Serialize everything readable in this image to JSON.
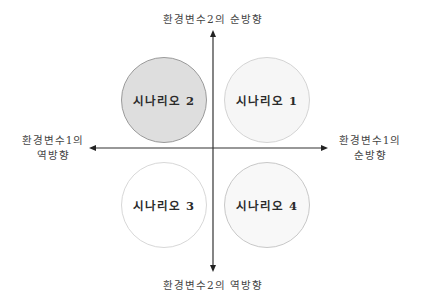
{
  "diagram": {
    "type": "scenario-matrix",
    "axes": {
      "vertical": {
        "top_label": "환경변수2의  순방향",
        "bottom_label": "환경변수2의  역방향"
      },
      "horizontal": {
        "left_label_line1": "환경변수1의",
        "left_label_line2": "역방향",
        "right_label_line1": "환경변수1의",
        "right_label_line2": "순방향"
      }
    },
    "scenarios": [
      {
        "label": "시나리오 2",
        "quadrant": "top-left",
        "fill": "#dedede",
        "border": "#9a9a9a"
      },
      {
        "label": "시나리오 1",
        "quadrant": "top-right",
        "fill": "#f6f6f6",
        "border": "#d4d4d4"
      },
      {
        "label": "시나리오 3",
        "quadrant": "bottom-left",
        "fill": "#ffffff",
        "border": "#d8d8d8"
      },
      {
        "label": "시나리오 4",
        "quadrant": "bottom-right",
        "fill": "#f8f8f8",
        "border": "#c8c8c8"
      }
    ],
    "colors": {
      "axis": "#333333",
      "text": "#444444"
    }
  }
}
